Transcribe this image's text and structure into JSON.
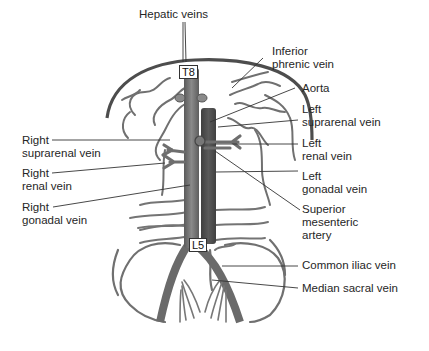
{
  "figure": {
    "type": "anatomical-diagram",
    "colors": {
      "vein": "#6e6e6e",
      "vein_dark": "#555555",
      "aorta": "#4a4a4a",
      "diaphragm": "#4d4d4d",
      "leader_line": "#333333",
      "text": "#262626"
    },
    "vertebra_markers": {
      "upper": "T8",
      "lower": "L5"
    },
    "labels_top": {
      "hepatic_veins": "Hepatic veins"
    },
    "labels_right": [
      {
        "id": "inferior-phrenic-vein",
        "lines": [
          "Inferior",
          "phrenic vein"
        ]
      },
      {
        "id": "aorta",
        "lines": [
          "Aorta"
        ]
      },
      {
        "id": "left-suprarenal-vein",
        "lines": [
          "Left",
          "suprarenal vein"
        ]
      },
      {
        "id": "left-renal-vein",
        "lines": [
          "Left",
          "renal vein"
        ]
      },
      {
        "id": "left-gonadal-vein",
        "lines": [
          "Left",
          "gonadal vein"
        ]
      },
      {
        "id": "superior-mesenteric-artery",
        "lines": [
          "Superior",
          "mesenteric",
          "artery"
        ]
      },
      {
        "id": "common-iliac-vein",
        "lines": [
          "Common iliac vein"
        ]
      },
      {
        "id": "median-sacral-vein",
        "lines": [
          "Median sacral vein"
        ]
      }
    ],
    "labels_left": [
      {
        "id": "right-suprarenal-vein",
        "lines": [
          "Right",
          "suprarenal vein"
        ]
      },
      {
        "id": "right-renal-vein",
        "lines": [
          "Right",
          "renal vein"
        ]
      },
      {
        "id": "right-gonadal-vein",
        "lines": [
          "Right",
          "gonadal vein"
        ]
      }
    ]
  }
}
